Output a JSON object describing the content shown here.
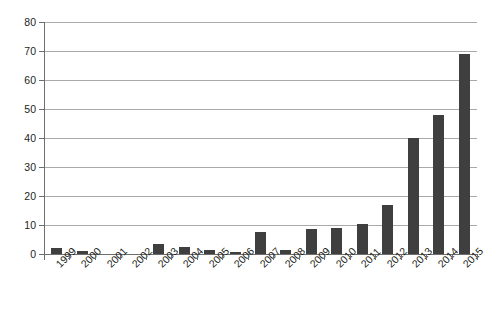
{
  "chart_data": {
    "type": "bar",
    "title": "",
    "subtitle": "",
    "xlabel": "",
    "ylabel": "",
    "categories": [
      "1999",
      "2000",
      "2001",
      "2002",
      "2003",
      "2004",
      "2005",
      "2006",
      "2007",
      "2008",
      "2009",
      "2010",
      "2011",
      "2012",
      "2013",
      "2014",
      "2015"
    ],
    "values": [
      2,
      1,
      0,
      0,
      3.5,
      2.5,
      1.5,
      0.8,
      7.5,
      1.5,
      8.5,
      9,
      10.5,
      17,
      40,
      48,
      69
    ],
    "series": [
      {
        "name": "",
        "values": [
          2,
          1,
          0,
          0,
          3.5,
          2.5,
          1.5,
          0.8,
          7.5,
          1.5,
          8.5,
          9,
          10.5,
          17,
          40,
          48,
          69
        ]
      }
    ],
    "ylim": [
      0,
      80
    ],
    "yticks": [
      0,
      10,
      20,
      30,
      40,
      50,
      60,
      70,
      80
    ],
    "ytick_labels": [
      "0",
      "10",
      "20",
      "30",
      "40",
      "50",
      "60",
      "70",
      "80"
    ],
    "grid": "horizontal",
    "legend": "none",
    "annotations": [],
    "colors": {
      "bar": "#3f3f3f",
      "gridline": "#a9a9a9",
      "axis": "#6e6e6e",
      "text": "#231f20",
      "background": "#ffffff"
    }
  }
}
